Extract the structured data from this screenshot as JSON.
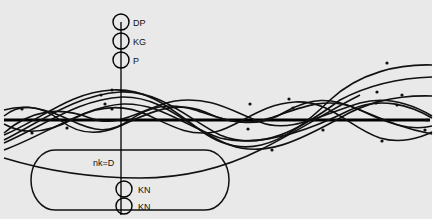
{
  "diagram": {
    "background": "#e9e9e9",
    "ink": "#111111",
    "top_rings": [
      {
        "label": "DP"
      },
      {
        "label": "KG"
      },
      {
        "label": "P"
      }
    ],
    "bottom_rings": [
      {
        "label": "KN"
      },
      {
        "label": "KN"
      }
    ],
    "loop_label": "nk=D"
  }
}
